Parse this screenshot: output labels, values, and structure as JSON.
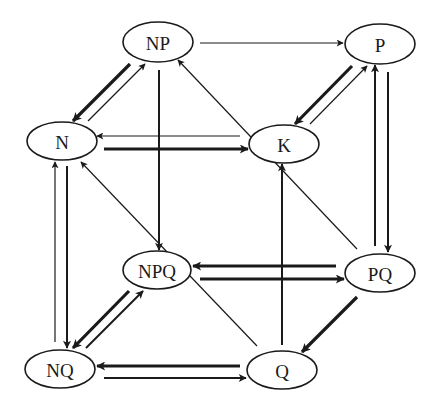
{
  "diagram": {
    "type": "directed-graph",
    "layout": "cube",
    "colors": {
      "stroke": "#1a1a1a",
      "background": "#ffffff"
    },
    "nodes": [
      {
        "id": "NP",
        "label": "NP",
        "cx": 158,
        "cy": 42,
        "rx": 35,
        "ry": 20
      },
      {
        "id": "P",
        "label": "P",
        "cx": 380,
        "cy": 44,
        "rx": 35,
        "ry": 20
      },
      {
        "id": "N",
        "label": "N",
        "cx": 62,
        "cy": 141,
        "rx": 35,
        "ry": 19
      },
      {
        "id": "K",
        "label": "K",
        "cx": 284,
        "cy": 144,
        "rx": 35,
        "ry": 19
      },
      {
        "id": "NPQ",
        "label": "NPQ",
        "cx": 157,
        "cy": 270,
        "rx": 34,
        "ry": 19
      },
      {
        "id": "PQ",
        "label": "PQ",
        "cx": 380,
        "cy": 273,
        "rx": 35,
        "ry": 19
      },
      {
        "id": "NQ",
        "label": "NQ",
        "cx": 60,
        "cy": 369,
        "rx": 35,
        "ry": 19
      },
      {
        "id": "Q",
        "label": "Q",
        "cx": 282,
        "cy": 370,
        "rx": 35,
        "ry": 19
      }
    ],
    "edges": [
      {
        "from": "NP",
        "to": "P",
        "weight": "thin",
        "x1": 200,
        "y1": 43,
        "x2": 343,
        "y2": 43
      },
      {
        "from": "NP",
        "to": "N",
        "weight": "thick",
        "x1": 130,
        "y1": 64,
        "x2": 73,
        "y2": 121
      },
      {
        "from": "N",
        "to": "NP",
        "weight": "thin",
        "x1": 88,
        "y1": 121,
        "x2": 145,
        "y2": 64
      },
      {
        "from": "P",
        "to": "K",
        "weight": "thick",
        "x1": 352,
        "y1": 66,
        "x2": 295,
        "y2": 124
      },
      {
        "from": "K",
        "to": "P",
        "weight": "thin",
        "x1": 310,
        "y1": 124,
        "x2": 367,
        "y2": 66
      },
      {
        "from": "K",
        "to": "N",
        "weight": "thin",
        "x1": 240,
        "y1": 136,
        "x2": 97,
        "y2": 136
      },
      {
        "from": "N",
        "to": "K",
        "weight": "thick",
        "x1": 104,
        "y1": 149,
        "x2": 248,
        "y2": 149
      },
      {
        "from": "PQ",
        "to": "NP",
        "weight": "thin",
        "x1": 357,
        "y1": 249,
        "x2": 178,
        "y2": 60
      },
      {
        "from": "NP",
        "to": "NPQ",
        "weight": "medium",
        "x1": 159,
        "y1": 70,
        "x2": 159,
        "y2": 250
      },
      {
        "from": "Q",
        "to": "K",
        "weight": "medium",
        "x1": 282,
        "y1": 345,
        "x2": 282,
        "y2": 164
      },
      {
        "from": "Q",
        "to": "N",
        "weight": "thin",
        "x1": 257,
        "y1": 346,
        "x2": 81,
        "y2": 162
      },
      {
        "from": "NQ",
        "to": "N",
        "weight": "thin",
        "x1": 55,
        "y1": 342,
        "x2": 55,
        "y2": 162
      },
      {
        "from": "N",
        "to": "NQ",
        "weight": "medium",
        "x1": 67,
        "y1": 166,
        "x2": 67,
        "y2": 348
      },
      {
        "from": "P",
        "to": "PQ",
        "weight": "medium",
        "x1": 388,
        "y1": 72,
        "x2": 388,
        "y2": 252
      },
      {
        "from": "PQ",
        "to": "P",
        "weight": "medium",
        "x1": 375,
        "y1": 246,
        "x2": 375,
        "y2": 65
      },
      {
        "from": "PQ",
        "to": "NPQ",
        "weight": "thick",
        "x1": 336,
        "y1": 266,
        "x2": 193,
        "y2": 266
      },
      {
        "from": "NPQ",
        "to": "NPQ_PQ",
        "weight": "thick",
        "x1": 200,
        "y1": 279,
        "x2": 344,
        "y2": 279,
        "to_node": "PQ"
      },
      {
        "from": "PQ",
        "to": "Q",
        "weight": "thick",
        "x1": 357,
        "y1": 297,
        "x2": 302,
        "y2": 352
      },
      {
        "from": "NPQ",
        "to": "NQ",
        "weight": "thick",
        "x1": 129,
        "y1": 291,
        "x2": 73,
        "y2": 348
      },
      {
        "from": "NQ",
        "to": "NPQ",
        "weight": "medium",
        "x1": 86,
        "y1": 348,
        "x2": 143,
        "y2": 291
      },
      {
        "from": "Q",
        "to": "NQ",
        "weight": "thick",
        "x1": 240,
        "y1": 366,
        "x2": 97,
        "y2": 366
      },
      {
        "from": "NQ",
        "to": "Q",
        "weight": "medium",
        "x1": 104,
        "y1": 378,
        "x2": 246,
        "y2": 378
      }
    ]
  }
}
